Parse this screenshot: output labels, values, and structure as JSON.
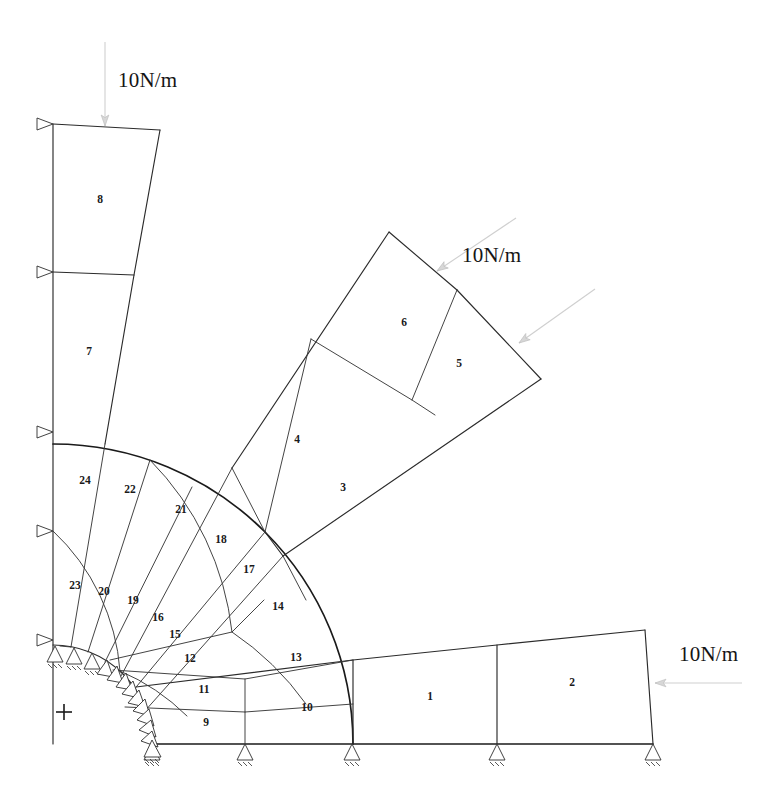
{
  "figure": {
    "title": "",
    "background_color": "#ffffff",
    "line_color": "#2b2b2b",
    "load_arrow_color": "#cfcfcf",
    "width": 767,
    "height": 792
  },
  "loads": [
    {
      "id": "load-top",
      "label": "10N/m",
      "label_x": 118,
      "label_y": 82,
      "direction": "downward",
      "applied_to": "top edge of element 8"
    },
    {
      "id": "load-upper-right-a",
      "label": "10N/m",
      "label_x": 462,
      "label_y": 257,
      "direction": "down-left diagonal",
      "applied_to": "upper edge of element 6"
    },
    {
      "id": "load-upper-right-b",
      "label": "",
      "label_x": 0,
      "label_y": 0,
      "direction": "down-left diagonal",
      "applied_to": "upper edge of element 5"
    },
    {
      "id": "load-right",
      "label": "10N/m",
      "label_x": 679,
      "label_y": 656,
      "direction": "leftward",
      "applied_to": "right edge of element 2"
    }
  ],
  "elements": [
    {
      "id": 1,
      "label": "1",
      "x": 430,
      "y": 697
    },
    {
      "id": 2,
      "label": "2",
      "x": 572,
      "y": 683
    },
    {
      "id": 3,
      "label": "3",
      "x": 343,
      "y": 488
    },
    {
      "id": 4,
      "label": "4",
      "x": 297,
      "y": 440
    },
    {
      "id": 5,
      "label": "5",
      "x": 459,
      "y": 364
    },
    {
      "id": 6,
      "label": "6",
      "x": 404,
      "y": 323
    },
    {
      "id": 7,
      "label": "7",
      "x": 89,
      "y": 352
    },
    {
      "id": 8,
      "label": "8",
      "x": 100,
      "y": 200
    },
    {
      "id": 9,
      "label": "9",
      "x": 206,
      "y": 723
    },
    {
      "id": 10,
      "label": "10",
      "x": 307,
      "y": 708
    },
    {
      "id": 11,
      "label": "11",
      "x": 204,
      "y": 690
    },
    {
      "id": 12,
      "label": "12",
      "x": 190,
      "y": 659
    },
    {
      "id": 13,
      "label": "13",
      "x": 296,
      "y": 658
    },
    {
      "id": 14,
      "label": "14",
      "x": 278,
      "y": 607
    },
    {
      "id": 15,
      "label": "15",
      "x": 175,
      "y": 635
    },
    {
      "id": 16,
      "label": "16",
      "x": 158,
      "y": 618
    },
    {
      "id": 17,
      "label": "17",
      "x": 249,
      "y": 570
    },
    {
      "id": 18,
      "label": "18",
      "x": 221,
      "y": 540
    },
    {
      "id": 19,
      "label": "19",
      "x": 133,
      "y": 601
    },
    {
      "id": 20,
      "label": "20",
      "x": 104,
      "y": 592
    },
    {
      "id": 21,
      "label": "21",
      "x": 181,
      "y": 510
    },
    {
      "id": 22,
      "label": "22",
      "x": 130,
      "y": 490
    },
    {
      "id": 23,
      "label": "23",
      "x": 75,
      "y": 586
    },
    {
      "id": 24,
      "label": "24",
      "x": 85,
      "y": 481
    }
  ],
  "supports": {
    "left_edge_rollers": [
      {
        "x": 53,
        "y": 125
      },
      {
        "x": 53,
        "y": 272
      },
      {
        "x": 53,
        "y": 432
      },
      {
        "x": 53,
        "y": 531
      },
      {
        "x": 53,
        "y": 640
      }
    ],
    "bottom_edge_rollers": [
      {
        "x": 152,
        "y": 745
      },
      {
        "x": 245,
        "y": 745
      },
      {
        "x": 352,
        "y": 745
      },
      {
        "x": 497,
        "y": 745
      },
      {
        "x": 653,
        "y": 745
      }
    ],
    "arc_roller_count": 16,
    "corner_roller_count": 3,
    "type": "roller"
  },
  "origin_marker": {
    "symbol": "+",
    "x": 64,
    "y": 712
  },
  "geometry": {
    "arc_center": {
      "x": 53,
      "y": 744
    },
    "inner_radius": 90,
    "outer_radius": 300,
    "mid_radius": 205
  }
}
